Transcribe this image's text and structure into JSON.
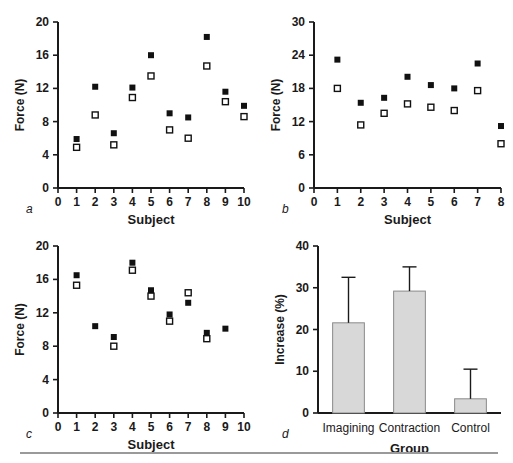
{
  "figure": {
    "background_color": "#ffffff",
    "axis_color": "#1a1a1a",
    "filled_marker_color": "#111111",
    "open_marker_color": "#ffffff",
    "open_marker_edge_color": "#111111",
    "bar_fill_color": "#d8d8d8",
    "bar_edge_color": "#8a8a8a",
    "rule_color": "#9a9a9a"
  },
  "chart_data": [
    {
      "panel_label": "a",
      "type": "scatter",
      "title": "",
      "xlabel": "Subject",
      "ylabel": "Force (N)",
      "xlim": [
        0,
        10
      ],
      "ylim": [
        0,
        20
      ],
      "xticks": [
        0,
        1,
        2,
        3,
        4,
        5,
        6,
        7,
        8,
        9,
        10
      ],
      "xticklabels": [
        "0",
        "1",
        "2",
        "3",
        "4",
        "5",
        "6",
        "7",
        "8",
        "9",
        "10"
      ],
      "yticks": [
        0,
        4,
        8,
        12,
        16,
        20
      ],
      "yticklabels": [
        "0",
        "4",
        "8",
        "12",
        "16",
        "20"
      ],
      "grid": false,
      "legend": "none",
      "x": [
        1,
        2,
        3,
        4,
        5,
        6,
        7,
        8,
        9,
        10
      ],
      "series": [
        {
          "name": "Post-training (filled square)",
          "marker": "filled-square",
          "values": [
            5.9,
            12.2,
            6.6,
            12.1,
            16.0,
            9.0,
            8.5,
            18.2,
            11.6,
            9.9
          ]
        },
        {
          "name": "Pre-training (open square)",
          "marker": "open-square",
          "values": [
            4.9,
            8.8,
            5.2,
            10.9,
            13.5,
            7.0,
            6.0,
            14.7,
            10.4,
            8.6
          ]
        }
      ]
    },
    {
      "panel_label": "b",
      "type": "scatter",
      "title": "",
      "xlabel": "Subject",
      "ylabel": "Force (N)",
      "xlim": [
        0,
        8
      ],
      "ylim": [
        0,
        30
      ],
      "xticks": [
        0,
        1,
        2,
        3,
        4,
        5,
        6,
        7,
        8
      ],
      "xticklabels": [
        "0",
        "1",
        "2",
        "3",
        "4",
        "5",
        "6",
        "7",
        "8"
      ],
      "yticks": [
        0,
        6,
        12,
        18,
        24,
        30
      ],
      "yticklabels": [
        "0",
        "6",
        "12",
        "18",
        "24",
        "30"
      ],
      "grid": false,
      "legend": "none",
      "x": [
        1,
        2,
        3,
        4,
        5,
        6,
        7,
        8
      ],
      "series": [
        {
          "name": "Post-training (filled square)",
          "marker": "filled-square",
          "values": [
            23.2,
            15.4,
            16.3,
            20.1,
            18.6,
            18.0,
            22.5,
            11.2
          ]
        },
        {
          "name": "Pre-training (open square)",
          "marker": "open-square",
          "values": [
            18.0,
            11.4,
            13.5,
            15.2,
            14.6,
            14.0,
            17.6,
            8.0
          ]
        }
      ]
    },
    {
      "panel_label": "c",
      "type": "scatter",
      "title": "",
      "xlabel": "Subject",
      "ylabel": "Force (N)",
      "xlim": [
        0,
        10
      ],
      "ylim": [
        0,
        20
      ],
      "xticks": [
        0,
        1,
        2,
        3,
        4,
        5,
        6,
        7,
        8,
        9,
        10
      ],
      "xticklabels": [
        "0",
        "1",
        "2",
        "3",
        "4",
        "5",
        "6",
        "7",
        "8",
        "9",
        "10"
      ],
      "yticks": [
        0,
        4,
        8,
        12,
        16,
        20
      ],
      "yticklabels": [
        "0",
        "4",
        "8",
        "12",
        "16",
        "20"
      ],
      "grid": false,
      "legend": "none",
      "x": [
        1,
        2,
        3,
        4,
        5,
        6,
        7,
        8,
        9
      ],
      "series": [
        {
          "name": "Post-training (filled square)",
          "marker": "filled-square",
          "values": [
            16.5,
            10.4,
            9.1,
            18.0,
            14.7,
            11.8,
            13.2,
            9.6,
            10.1
          ]
        },
        {
          "name": "Pre-training (open square)",
          "marker": "open-square",
          "values": [
            15.3,
            null,
            8.0,
            17.1,
            14.0,
            11.0,
            14.4,
            8.9,
            null
          ]
        }
      ]
    },
    {
      "panel_label": "d",
      "type": "bar",
      "title": "",
      "xlabel": "Group",
      "ylabel": "Increase (%)",
      "ylim": [
        0,
        40
      ],
      "yticks": [
        0,
        10,
        20,
        30,
        40
      ],
      "yticklabels": [
        "0",
        "10",
        "20",
        "30",
        "40"
      ],
      "grid": false,
      "legend": "none",
      "categories": [
        "Imagining",
        "Contraction",
        "Control"
      ],
      "values": [
        21.6,
        29.2,
        3.4
      ],
      "errors_upper": [
        32.5,
        35.0,
        10.5
      ]
    }
  ]
}
